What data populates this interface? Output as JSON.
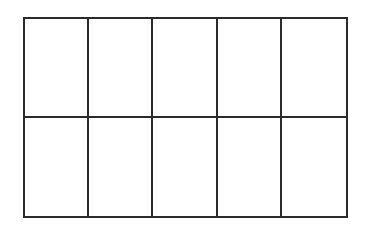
{
  "diagram": {
    "type": "grid",
    "rows": 2,
    "columns": 5,
    "cells": [
      [
        "",
        "",
        "",
        "",
        ""
      ],
      [
        "",
        "",
        "",
        "",
        ""
      ]
    ],
    "line_color": "#2b2b2b",
    "fill_color": "#ffffff"
  }
}
